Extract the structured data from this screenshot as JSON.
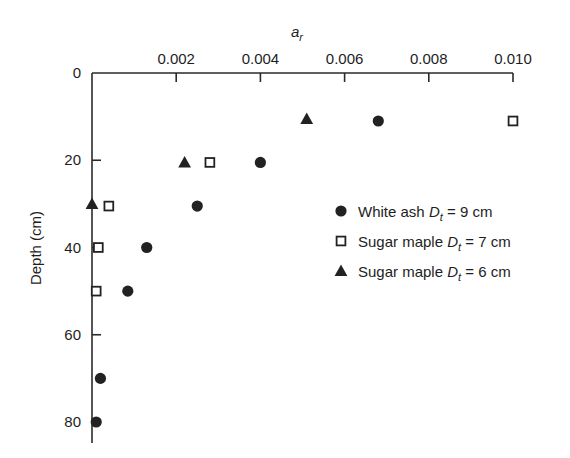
{
  "chart_data": {
    "type": "scatter",
    "title": "",
    "xlabel": "a_r",
    "ylabel": "Depth (cm)",
    "x_axis_position": "top",
    "y_axis_inverted": true,
    "xlim": [
      0,
      0.01
    ],
    "ylim": [
      0,
      85
    ],
    "x_ticks": [
      0.002,
      0.004,
      0.006,
      0.008,
      0.01
    ],
    "x_tick_labels": [
      "0.002",
      "0.004",
      "0.006",
      "0.008",
      "0.010"
    ],
    "y_ticks": [
      0,
      20,
      40,
      60,
      80
    ],
    "y_tick_labels": [
      "0",
      "20",
      "40",
      "60",
      "80"
    ],
    "grid": false,
    "legend_position": "right-middle",
    "series": [
      {
        "name": "White ash D_t = 9 cm",
        "legend_label": "White ash",
        "legend_param": "9 cm",
        "marker": "filled-circle",
        "points": [
          {
            "x": 0.0068,
            "y": 11
          },
          {
            "x": 0.004,
            "y": 20.5
          },
          {
            "x": 0.0025,
            "y": 30.5
          },
          {
            "x": 0.0013,
            "y": 40
          },
          {
            "x": 0.00085,
            "y": 50
          },
          {
            "x": 0.0002,
            "y": 70
          },
          {
            "x": 0.0001,
            "y": 80
          }
        ]
      },
      {
        "name": "Sugar maple D_t = 7 cm",
        "legend_label": "Sugar maple",
        "legend_param": "7 cm",
        "marker": "open-square",
        "points": [
          {
            "x": 0.01,
            "y": 11
          },
          {
            "x": 0.0028,
            "y": 20.5
          },
          {
            "x": 0.0004,
            "y": 30.5
          },
          {
            "x": 0.00015,
            "y": 40
          },
          {
            "x": 0.0001,
            "y": 50
          }
        ]
      },
      {
        "name": "Sugar maple D_t = 6 cm",
        "legend_label": "Sugar maple",
        "legend_param": "6 cm",
        "marker": "filled-triangle",
        "points": [
          {
            "x": 0.0051,
            "y": 10.5
          },
          {
            "x": 0.0022,
            "y": 20.5
          },
          {
            "x": 0.0,
            "y": 30
          }
        ]
      }
    ]
  },
  "labels": {
    "x_title_main": "a",
    "x_title_sub": "r",
    "y_title": "Depth (cm)",
    "legend_D": "D",
    "legend_sub": "t",
    "legend_eq": " = "
  }
}
